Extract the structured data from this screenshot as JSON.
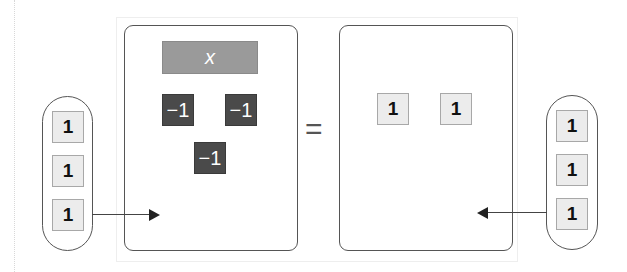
{
  "diagram": {
    "type": "algebra-tiles-equation",
    "left_side": {
      "variable_tile": {
        "label": "x"
      },
      "negative_tiles": [
        {
          "label": "−1"
        },
        {
          "label": "−1"
        },
        {
          "label": "−1"
        }
      ]
    },
    "equals": "=",
    "right_side": {
      "unit_tiles": [
        {
          "label": "1"
        },
        {
          "label": "1"
        }
      ]
    },
    "left_added_group": {
      "tiles": [
        {
          "label": "1"
        },
        {
          "label": "1"
        },
        {
          "label": "1"
        }
      ],
      "arrow_direction": "right"
    },
    "right_added_group": {
      "tiles": [
        {
          "label": "1"
        },
        {
          "label": "1"
        },
        {
          "label": "1"
        }
      ],
      "arrow_direction": "left"
    }
  }
}
